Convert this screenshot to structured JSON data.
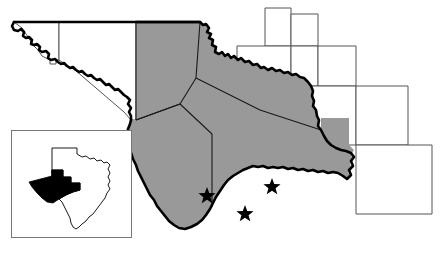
{
  "figure": {
    "name": "west-texas-region-map",
    "width": 441,
    "height": 255,
    "background_color": "#ffffff"
  },
  "colors": {
    "highlight_fill": "#999999",
    "plain_fill": "#ffffff",
    "heavy_outline": "#000000",
    "county_line": "#1a1a1a",
    "thin_county_line": "#555555",
    "inset_border": "#777777",
    "inset_state_line": "#000000",
    "inset_highlight_fill": "#000000",
    "star_fill": "#000000"
  },
  "main_map": {
    "name": "main-map",
    "description": "Shaded multi-county study region in far west Texas bounded on the south and west by the Rio Grande.",
    "highlight_region_label": "study-area",
    "outline_style": "heavy",
    "shaded_counties_count": 6,
    "unshaded_counties_count": 8
  },
  "markers": {
    "symbol": "star",
    "symbol_glyph": "★",
    "count": 3,
    "points": [
      {
        "name": "star-marker-1",
        "x": 207,
        "y": 196,
        "size": 9
      },
      {
        "name": "star-marker-2",
        "x": 245,
        "y": 214,
        "size": 9
      },
      {
        "name": "star-marker-3",
        "x": 272,
        "y": 187,
        "size": 9
      }
    ]
  },
  "inset": {
    "name": "texas-locator-inset",
    "description": "Small locator map of the state of Texas with the study region filled solid black in the far west.",
    "border_color": "#777777",
    "box": {
      "x": 11,
      "y": 130,
      "width": 121,
      "height": 108
    },
    "state_name": "Texas",
    "highlight_description": "west-texas-study-area"
  },
  "chart_data": {
    "type": "map",
    "legend": [],
    "annotations": [
      "★ study site",
      "★ study site",
      "★ study site"
    ]
  }
}
